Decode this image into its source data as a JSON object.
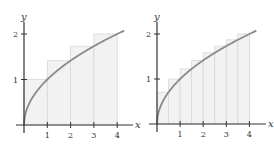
{
  "chart_data": [
    {
      "type": "area",
      "title": "",
      "function": "y = sqrt(x)",
      "xlabel": "x",
      "ylabel": "y",
      "xlim": [
        0,
        4.3
      ],
      "ylim": [
        0,
        2.2
      ],
      "x_ticks": [
        "1",
        "2",
        "3",
        "4"
      ],
      "y_ticks": [
        "1",
        "2"
      ],
      "grid": false,
      "rectangles": {
        "n": 4,
        "width": 1,
        "rule": "right endpoint",
        "x_left": [
          0,
          1,
          2,
          3
        ],
        "heights": [
          1,
          1.414,
          1.732,
          2
        ]
      },
      "colors": {
        "curve": "#8a8a8a",
        "rect_fill": "#f2f2f2",
        "rect_stroke": "#d8d8d8",
        "axis": "#333333"
      }
    },
    {
      "type": "area",
      "title": "",
      "function": "y = sqrt(x)",
      "xlabel": "x",
      "ylabel": "y",
      "xlim": [
        0,
        4.3
      ],
      "ylim": [
        0,
        2.2
      ],
      "x_ticks": [
        "1",
        "2",
        "3",
        "4"
      ],
      "y_ticks": [
        "1",
        "2"
      ],
      "grid": false,
      "rectangles": {
        "n": 8,
        "width": 0.5,
        "rule": "right endpoint",
        "x_left": [
          0,
          0.5,
          1,
          1.5,
          2,
          2.5,
          3,
          3.5
        ],
        "heights": [
          0.707,
          1,
          1.225,
          1.414,
          1.581,
          1.732,
          1.871,
          2
        ]
      },
      "colors": {
        "curve": "#8a8a8a",
        "rect_fill": "#f2f2f2",
        "rect_stroke": "#d8d8d8",
        "axis": "#333333"
      }
    }
  ]
}
